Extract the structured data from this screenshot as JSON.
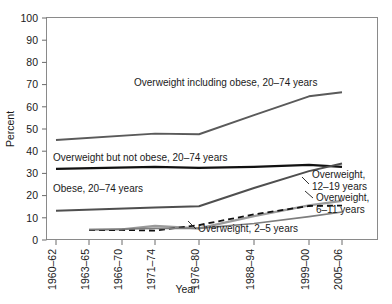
{
  "chart_data": {
    "type": "line",
    "title": "",
    "xlabel": "Year",
    "ylabel": "Percent",
    "ylim": [
      0,
      100
    ],
    "yticks": [
      0,
      10,
      20,
      30,
      40,
      50,
      60,
      70,
      80,
      90,
      100
    ],
    "grid": false,
    "legend_position": "inline-annotations",
    "categories": [
      "1960–62",
      "1963–65",
      "1966–70",
      "1971–74",
      "1976–80",
      "1988–94",
      "1999–00",
      "2005–06"
    ],
    "series": [
      {
        "name": "Overweight including obese, 20–74 years",
        "color": "#5a5a5a",
        "style": "solid",
        "width": 1.9,
        "x": [
          "1960–62",
          "1963–65",
          "1971–74",
          "1976–80",
          "1988–94",
          "1999–00",
          "2005–06"
        ],
        "values": [
          44.8,
          null,
          47.7,
          47.4,
          56.0,
          64.5,
          66.3
        ]
      },
      {
        "name": "Overweight but not obese, 20–74 years",
        "color": "#111111",
        "style": "solid",
        "width": 2.3,
        "x": [
          "1960–62",
          "1971–74",
          "1976–80",
          "1988–94",
          "1999–00",
          "2005–06"
        ],
        "values": [
          31.8,
          32.7,
          32.3,
          32.7,
          33.6,
          32.7
        ]
      },
      {
        "name": "Obese, 20–74 years",
        "color": "#4f4f4f",
        "style": "solid",
        "width": 2.0,
        "x": [
          "1960–62",
          "1971–74",
          "1976–80",
          "1988–94",
          "1999–00",
          "2005–06"
        ],
        "values": [
          13.0,
          14.4,
          15.0,
          23.2,
          30.8,
          34.2
        ]
      },
      {
        "name": "Overweight, 12–19 years",
        "color": "#9a9a9a",
        "style": "solid",
        "width": 2.2,
        "x": [
          "1963–65",
          "1966–70",
          "1971–74",
          "1976–80",
          "1988–94",
          "1999–00",
          "2005–06"
        ],
        "values": [
          4.5,
          4.6,
          6.1,
          5.0,
          10.5,
          15.4,
          17.4
        ]
      },
      {
        "name": "Overweight, 6–11 years",
        "color": "#111111",
        "style": "dashed",
        "width": 1.8,
        "x": [
          "1963–65",
          "1966–70",
          "1971–74",
          "1976–80",
          "1988–94",
          "1999–00",
          "2005–06"
        ],
        "values": [
          4.2,
          4.3,
          4.0,
          6.5,
          11.3,
          15.1,
          15.3
        ]
      },
      {
        "name": "Overweight, 2–5 years",
        "color": "#7d7d7d",
        "style": "solid",
        "width": 1.6,
        "x": [
          "1963–65",
          "1971–74",
          "1976–80",
          "1988–94",
          "1999–00",
          "2005–06"
        ],
        "values": [
          4.4,
          5.0,
          5.0,
          7.2,
          10.3,
          12.4
        ]
      }
    ],
    "annotations": [
      {
        "id": "ann-overweight-including-obese",
        "text": "Overweight including obese, 20–74 years",
        "x": 134,
        "y": 86,
        "anchor": "start"
      },
      {
        "id": "ann-overweight-not-obese",
        "text": "Overweight but not obese, 20–74 years",
        "x": 53,
        "y": 161,
        "anchor": "start"
      },
      {
        "id": "ann-obese",
        "text": "Obese, 20–74 years",
        "x": 53,
        "y": 192,
        "anchor": "start"
      },
      {
        "id": "ann-overweight-12-19-line1",
        "text": "Overweight,",
        "x": 312,
        "y": 178,
        "anchor": "start"
      },
      {
        "id": "ann-overweight-12-19-line2",
        "text": "12–19 years",
        "x": 312,
        "y": 190,
        "anchor": "start"
      },
      {
        "id": "ann-overweight-6-11-line1",
        "text": "Overweight,",
        "x": 316,
        "y": 201,
        "anchor": "start"
      },
      {
        "id": "ann-overweight-6-11-line2",
        "text": "6–11 years",
        "x": 316,
        "y": 213,
        "anchor": "start"
      },
      {
        "id": "ann-overweight-2-5",
        "text": "Overweight, 2–5 years",
        "x": 198,
        "y": 232,
        "anchor": "start"
      }
    ]
  }
}
